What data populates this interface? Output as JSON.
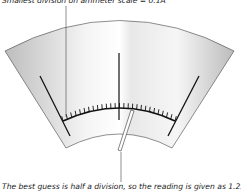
{
  "captions": {
    "top": "Smallest division on ammeter scale = 0.1A",
    "bottom": "The best guess is half a division, so the reading is given as 1.254"
  },
  "meter": {
    "tick_count": 27,
    "major_ticks": 3,
    "needle_reading_fraction": 0.55,
    "face_gradient_colors": [
      "#c8c8c8",
      "#ffffff"
    ]
  }
}
